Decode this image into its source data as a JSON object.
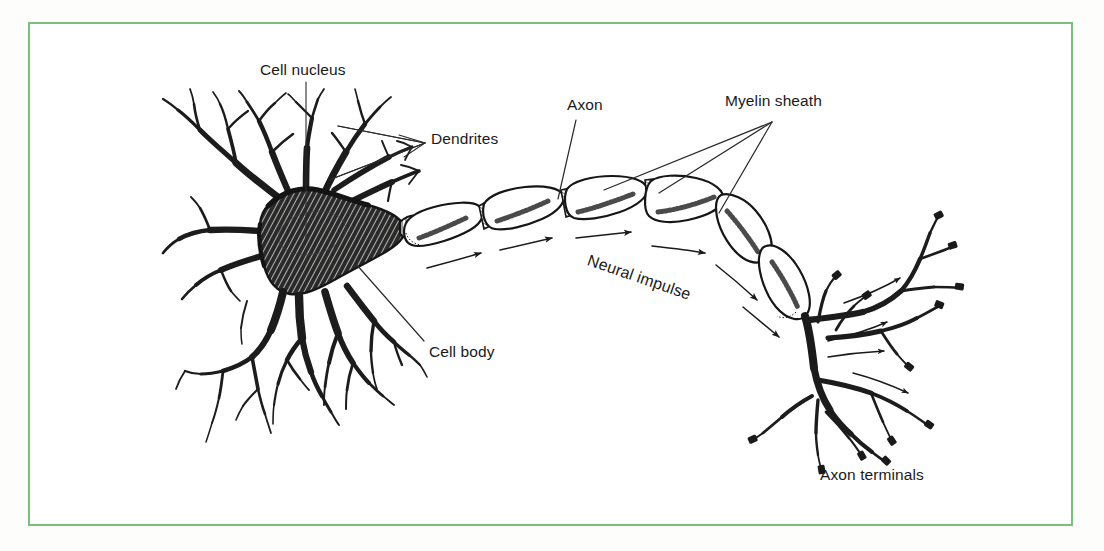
{
  "figure": {
    "border_color": "#7cbf7c",
    "background_color": "#ffffff",
    "ink_color": "#1a1a1a",
    "style": "pen-and-ink line drawing with cross-hatching"
  },
  "labels": {
    "cell_nucleus": "Cell nucleus",
    "dendrites": "Dendrites",
    "axon": "Axon",
    "myelin_sheath": "Myelin sheath",
    "cell_body": "Cell body",
    "neural_impulse": "Neural impulse",
    "axon_terminals": "Axon terminals"
  },
  "parts": [
    {
      "name": "cell-nucleus",
      "label": "Cell nucleus",
      "leader": "single vertical line down into soma"
    },
    {
      "name": "dendrites",
      "label": "Dendrites",
      "leader": "two lines fanning left to dendrite branches"
    },
    {
      "name": "axon",
      "label": "Axon",
      "leader": "single diagonal line to axon segment"
    },
    {
      "name": "myelin-sheath",
      "label": "Myelin sheath",
      "leader": "three lines fanning to myelin segments"
    },
    {
      "name": "cell-body",
      "label": "Cell body",
      "leader": "single diagonal line to soma"
    },
    {
      "name": "neural-impulse",
      "label": "Neural impulse",
      "leader": "curved arrows along the axon"
    },
    {
      "name": "axon-terminals",
      "label": "Axon terminals",
      "leader": "none"
    }
  ],
  "annotations": {
    "impulse_direction": "left to right, from cell body along axon to axon terminals",
    "myelin_segment_count": 6,
    "impulse_arrow_count": 8
  }
}
